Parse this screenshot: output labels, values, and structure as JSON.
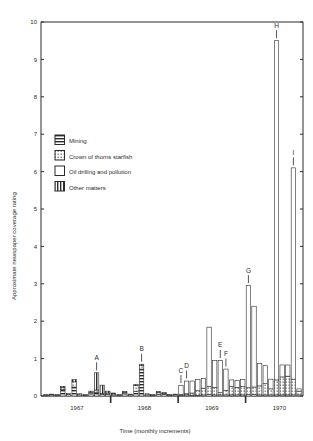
{
  "chart_data": {
    "type": "bar",
    "title": "",
    "subtitle": "",
    "xlabel": "Time (monthly increments)",
    "ylabel": "Approximate newspaper coverage rating",
    "ylim": [
      0,
      10
    ],
    "yticks": [
      0,
      1,
      2,
      3,
      4,
      5,
      6,
      7,
      8,
      9,
      10
    ],
    "ytick_labels": [
      "0",
      "1",
      "2",
      "3",
      "4",
      "5",
      "6",
      "7",
      "8",
      "9",
      "10"
    ],
    "grid": false,
    "stacked": true,
    "legend_position": "inside-upper-left",
    "series": [
      {
        "name": "Mining",
        "pattern": "horizontal-stripes"
      },
      {
        "name": "Crown of thorns starfish",
        "pattern": "dotted"
      },
      {
        "name": "Oil drilling and pollution",
        "pattern": "solid-white"
      },
      {
        "name": "Other matters",
        "pattern": "vertical-stripes"
      }
    ],
    "xtick_labels": [
      "1967",
      "1968",
      "1969",
      "1970"
    ],
    "xtick_marks": [
      "1967",
      "1968",
      "1969",
      "1970"
    ],
    "annotations": [
      {
        "label": "A",
        "bar_index": 9,
        "value": 0.62
      },
      {
        "label": "B",
        "bar_index": 17,
        "value": 0.85
      },
      {
        "label": "C",
        "bar_index": 24,
        "value": 0.28
      },
      {
        "label": "D",
        "bar_index": 25,
        "value": 0.4
      },
      {
        "label": "E",
        "bar_index": 31,
        "value": 0.95
      },
      {
        "label": "F",
        "bar_index": 32,
        "value": 0.72
      },
      {
        "label": "G",
        "bar_index": 36,
        "value": 2.95
      },
      {
        "label": "H",
        "bar_index": 41,
        "value": 9.5
      },
      {
        "label": "I",
        "bar_index": 44,
        "value": 6.1
      }
    ],
    "categories": [
      "1967-01",
      "1967-02",
      "1967-03",
      "1967-04",
      "1967-05",
      "1967-06",
      "1967-07",
      "1967-08",
      "1967-09",
      "1967-10",
      "1967-11",
      "1967-12",
      "1968-01",
      "1968-02",
      "1968-03",
      "1968-04",
      "1968-05",
      "1968-06",
      "1968-07",
      "1968-08",
      "1968-09",
      "1968-10",
      "1968-11",
      "1968-12",
      "1969-01",
      "1969-02",
      "1969-03",
      "1969-04",
      "1969-05",
      "1969-06",
      "1969-07",
      "1969-08",
      "1969-09",
      "1969-10",
      "1969-11",
      "1969-12",
      "1970-01",
      "1970-02",
      "1970-03",
      "1970-04",
      "1970-05",
      "1970-06",
      "1970-07",
      "1970-08",
      "1970-09",
      "1970-10"
    ],
    "stacks": [
      {
        "mining": 0.02,
        "starfish": 0.02,
        "oil": 0.0,
        "other": 0.0
      },
      {
        "mining": 0.03,
        "starfish": 0.02,
        "oil": 0.0,
        "other": 0.0
      },
      {
        "mining": 0.02,
        "starfish": 0.02,
        "oil": 0.0,
        "other": 0.0
      },
      {
        "mining": 0.18,
        "starfish": 0.05,
        "oil": 0.0,
        "other": 0.03
      },
      {
        "mining": 0.04,
        "starfish": 0.03,
        "oil": 0.0,
        "other": 0.0
      },
      {
        "mining": 0.24,
        "starfish": 0.14,
        "oil": 0.0,
        "other": 0.06
      },
      {
        "mining": 0.03,
        "starfish": 0.03,
        "oil": 0.0,
        "other": 0.0
      },
      {
        "mining": 0.02,
        "starfish": 0.02,
        "oil": 0.0,
        "other": 0.0
      },
      {
        "mining": 0.06,
        "starfish": 0.04,
        "oil": 0.0,
        "other": 0.03
      },
      {
        "mining": 0.1,
        "starfish": 0.06,
        "oil": 0.0,
        "other": 0.46
      },
      {
        "mining": 0.04,
        "starfish": 0.03,
        "oil": 0.0,
        "other": 0.22
      },
      {
        "mining": 0.05,
        "starfish": 0.03,
        "oil": 0.0,
        "other": 0.05
      },
      {
        "mining": 0.03,
        "starfish": 0.03,
        "oil": 0.0,
        "other": 0.02
      },
      {
        "mining": 0.02,
        "starfish": 0.02,
        "oil": 0.0,
        "other": 0.0
      },
      {
        "mining": 0.06,
        "starfish": 0.04,
        "oil": 0.0,
        "other": 0.02
      },
      {
        "mining": 0.03,
        "starfish": 0.02,
        "oil": 0.0,
        "other": 0.0
      },
      {
        "mining": 0.12,
        "starfish": 0.16,
        "oil": 0.0,
        "other": 0.03
      },
      {
        "mining": 0.72,
        "starfish": 0.09,
        "oil": 0.0,
        "other": 0.04
      },
      {
        "mining": 0.03,
        "starfish": 0.03,
        "oil": 0.0,
        "other": 0.0
      },
      {
        "mining": 0.02,
        "starfish": 0.02,
        "oil": 0.0,
        "other": 0.0
      },
      {
        "mining": 0.05,
        "starfish": 0.05,
        "oil": 0.0,
        "other": 0.02
      },
      {
        "mining": 0.04,
        "starfish": 0.03,
        "oil": 0.0,
        "other": 0.02
      },
      {
        "mining": 0.02,
        "starfish": 0.02,
        "oil": 0.0,
        "other": 0.0
      },
      {
        "mining": 0.03,
        "starfish": 0.02,
        "oil": 0.0,
        "other": 0.0
      },
      {
        "mining": 0.02,
        "starfish": 0.02,
        "oil": 0.24,
        "other": 0.0
      },
      {
        "mining": 0.03,
        "starfish": 0.03,
        "oil": 0.34,
        "other": 0.0
      },
      {
        "mining": 0.02,
        "starfish": 0.06,
        "oil": 0.32,
        "other": 0.0
      },
      {
        "mining": 0.02,
        "starfish": 0.12,
        "oil": 0.3,
        "other": 0.0
      },
      {
        "mining": 0.03,
        "starfish": 0.18,
        "oil": 0.26,
        "other": 0.0
      },
      {
        "mining": 0.04,
        "starfish": 0.22,
        "oil": 1.58,
        "other": 0.0
      },
      {
        "mining": 0.03,
        "starfish": 0.2,
        "oil": 0.72,
        "other": 0.0
      },
      {
        "mining": 0.03,
        "starfish": 0.06,
        "oil": 0.86,
        "other": 0.0
      },
      {
        "mining": 0.03,
        "starfish": 0.12,
        "oil": 0.57,
        "other": 0.0
      },
      {
        "mining": 0.03,
        "starfish": 0.22,
        "oil": 0.18,
        "other": 0.0
      },
      {
        "mining": 0.03,
        "starfish": 0.2,
        "oil": 0.19,
        "other": 0.0
      },
      {
        "mining": 0.03,
        "starfish": 0.22,
        "oil": 0.19,
        "other": 0.0
      },
      {
        "mining": 0.04,
        "starfish": 0.18,
        "oil": 2.73,
        "other": 0.0
      },
      {
        "mining": 0.04,
        "starfish": 0.2,
        "oil": 2.16,
        "other": 0.0
      },
      {
        "mining": 0.03,
        "starfish": 0.24,
        "oil": 0.6,
        "other": 0.0
      },
      {
        "mining": 0.03,
        "starfish": 0.3,
        "oil": 0.48,
        "other": 0.0
      },
      {
        "mining": 0.03,
        "starfish": 0.16,
        "oil": 0.26,
        "other": 0.0
      },
      {
        "mining": 0.03,
        "starfish": 0.4,
        "oil": 9.07,
        "other": 0.0
      },
      {
        "mining": 0.03,
        "starfish": 0.48,
        "oil": 0.32,
        "other": 0.0
      },
      {
        "mining": 0.03,
        "starfish": 0.5,
        "oil": 0.3,
        "other": 0.0
      },
      {
        "mining": 0.03,
        "starfish": 0.42,
        "oil": 5.65,
        "other": 0.0
      },
      {
        "mining": 0.03,
        "starfish": 0.1,
        "oil": 0.06,
        "other": 0.0
      }
    ]
  },
  "legend": {
    "items": [
      {
        "label": "Mining",
        "swatch": "swatch-mining"
      },
      {
        "label": "Crown of thorns starfish",
        "swatch": "swatch-starfish"
      },
      {
        "label": "Oil drilling and pollution",
        "swatch": "swatch-oil"
      },
      {
        "label": "Other matters",
        "swatch": "swatch-other"
      }
    ]
  },
  "axes": {
    "y_title": "Approximate newspaper coverage rating",
    "x_title": "Time (monthly increments)"
  },
  "colors": {
    "ink": "#2b2b2b",
    "paper": "#ffffff"
  }
}
